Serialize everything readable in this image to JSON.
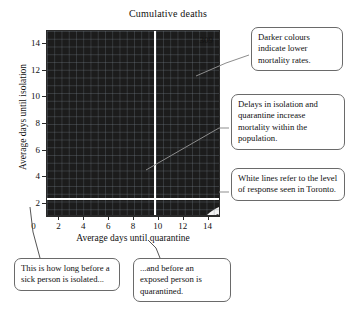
{
  "chart_data": {
    "type": "heatmap",
    "title": "Cumulative deaths",
    "xlabel": "Average days until quarantine",
    "ylabel": "Average days until isolation",
    "xlim": [
      1,
      15
    ],
    "ylim": [
      1,
      15
    ],
    "xticks": [
      0,
      2,
      4,
      6,
      8,
      10,
      12,
      14
    ],
    "yticks": [
      2,
      4,
      6,
      8,
      10,
      12,
      14
    ],
    "xtick_labels": [
      "0",
      "2",
      "4",
      "6",
      "8",
      "10",
      "12",
      "14"
    ],
    "ytick_labels": [
      "2",
      "4",
      "6",
      "8",
      "10",
      "12",
      "14"
    ],
    "grid": true,
    "legend": "none",
    "corner_annotation": "309",
    "colormap": "grayscale-inverted",
    "colormap_note": "Darker colours indicate lower mortality rates; lightest band is upper-right corner.",
    "contour_levels": [
      {
        "index": 0,
        "color": "#0a0a0a",
        "meaning": "lowest mortality"
      },
      {
        "index": 1,
        "color": "#1b1b1b"
      },
      {
        "index": 2,
        "color": "#2c2c2c"
      },
      {
        "index": 3,
        "color": "#3e3e3e"
      },
      {
        "index": 4,
        "color": "#545454"
      },
      {
        "index": 5,
        "color": "#6d6d6d"
      },
      {
        "index": 6,
        "color": "#8a8a8a"
      },
      {
        "index": 7,
        "color": "#a8a8a8"
      },
      {
        "index": 8,
        "color": "#c6c6c6"
      },
      {
        "index": 9,
        "color": "#e2e2e2"
      },
      {
        "index": 10,
        "color": "#f7f7f7",
        "meaning": "highest mortality"
      }
    ],
    "reference_lines": [
      {
        "orientation": "horizontal",
        "axis": "y",
        "value": 2.3,
        "color": "#ffffff",
        "label": "Toronto level of response"
      },
      {
        "orientation": "vertical",
        "axis": "x",
        "value": 9.7,
        "color": "#ffffff",
        "label": "Toronto level of response"
      }
    ]
  },
  "annotations": {
    "darker": "Darker colours indicate lower mortality rates.",
    "delays": "Delays in isolation and quarantine increase mortality within the population.",
    "white_lines": "White lines refer to the level of response seen in Toronto.",
    "sick": "This is how long before a sick person is isolated...",
    "exposed": "...and before an exposed person is quarantined."
  }
}
